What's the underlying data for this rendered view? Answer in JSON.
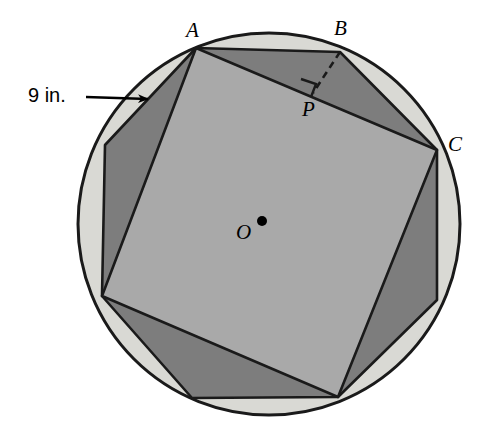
{
  "figure": {
    "type": "geometry-diagram",
    "background_color": "#ffffff",
    "colors": {
      "circle_ring_fill": "#d9d9d4",
      "circle_outline": "#1a1a1a",
      "octagon_fill": "#7d7d7d",
      "square_fill": "#a9a9a9",
      "stroke": "#1a1a1a",
      "label_color": "#000000"
    },
    "circle": {
      "center_x": 269,
      "center_y": 224,
      "radius": 191,
      "stroke_width": 3
    },
    "octagon_vertices": [
      {
        "name": "A",
        "x": 196,
        "y": 48
      },
      {
        "name": "B",
        "x": 340,
        "y": 52
      },
      {
        "name": "C",
        "x": 437,
        "y": 150
      },
      {
        "name": "",
        "x": 437,
        "y": 300
      },
      {
        "name": "",
        "x": 338,
        "y": 397
      },
      {
        "name": "",
        "x": 192,
        "y": 398
      },
      {
        "name": "",
        "x": 102,
        "y": 296
      },
      {
        "name": "",
        "x": 105,
        "y": 145
      }
    ],
    "square_vertices": [
      {
        "x": 196,
        "y": 48
      },
      {
        "x": 437,
        "y": 150
      },
      {
        "x": 338,
        "y": 397
      },
      {
        "x": 102,
        "y": 296
      }
    ],
    "perpendicular": {
      "from_point": "B",
      "from_x": 340,
      "from_y": 52,
      "to_point": "P",
      "to_x": 313,
      "to_y": 93,
      "style": "dashed",
      "right_angle_marker": true
    }
  },
  "labels": {
    "point_a": "A",
    "point_b": "B",
    "point_c": "C",
    "point_o": "O",
    "point_p": "P",
    "dimension": "9 in."
  },
  "annotation": {
    "leader_line": {
      "start_x": 86,
      "start_y": 97,
      "end_x": 150,
      "end_y": 99,
      "arrowhead": "end"
    }
  }
}
